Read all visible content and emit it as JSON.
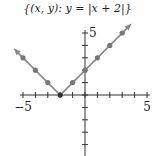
{
  "title": "{(x, y): y = |x + 2|}",
  "chart_data": {
    "type": "line",
    "title": "{(x, y): y = |x + 2|}",
    "xlabel": "",
    "ylabel": "",
    "xlim": [
      -5,
      5
    ],
    "ylim": [
      -5,
      5
    ],
    "x_tick_labels": [
      "-5",
      "5"
    ],
    "y_tick_labels": [
      "5",
      "-5"
    ],
    "grid": false,
    "x": [
      -5,
      -4,
      -3,
      -2,
      -1,
      0,
      1,
      2,
      3
    ],
    "series": [
      {
        "name": "y = |x + 2|",
        "values": [
          3,
          2,
          1,
          0,
          1,
          2,
          3,
          4,
          5
        ]
      }
    ],
    "vertex": [
      -2,
      0
    ],
    "arrows": true
  },
  "colors": {
    "line": "#888888",
    "point": "#777777",
    "vertex": "#333333",
    "axis": "#333333"
  }
}
